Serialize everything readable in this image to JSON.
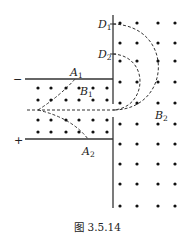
{
  "figure": {
    "caption": "图 3.5.14",
    "labels": {
      "D1": {
        "main": "D",
        "sub": "1"
      },
      "D2": {
        "main": "D",
        "sub": "2"
      },
      "A1": {
        "main": "A",
        "sub": "1"
      },
      "A2": {
        "main": "A",
        "sub": "2"
      },
      "B1": {
        "main": "B",
        "sub": "1"
      },
      "B2": {
        "main": "B",
        "sub": "2"
      }
    },
    "plate_signs": {
      "top": "−",
      "bottom": "+"
    },
    "field_symbol": "dot (field out of page)",
    "colors": {
      "ink": "#222222",
      "background": "#ffffff"
    }
  }
}
